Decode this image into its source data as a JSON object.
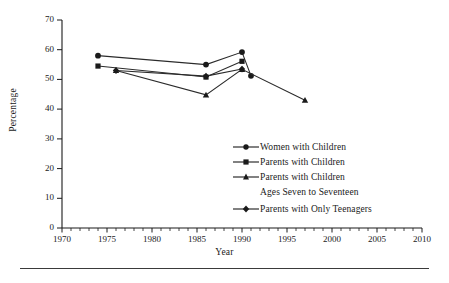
{
  "chart_data": {
    "type": "line",
    "title": "",
    "xlabel": "Year",
    "ylabel": "Percentage",
    "xlim": [
      1970,
      2010
    ],
    "ylim": [
      0,
      70
    ],
    "xticks": [
      1970,
      1975,
      1980,
      1985,
      1990,
      1995,
      2000,
      2005,
      2010
    ],
    "yticks": [
      0,
      10,
      20,
      30,
      40,
      50,
      60,
      70
    ],
    "xtick_step_minor": 1,
    "grid": false,
    "legend_position": "center-right",
    "series": [
      {
        "name": "Women with Children",
        "marker": "circle",
        "x": [
          1974,
          1986,
          1990,
          1991
        ],
        "y": [
          58.0,
          55.0,
          59.2,
          51.2
        ]
      },
      {
        "name": "Parents with Children",
        "marker": "square",
        "x": [
          1974,
          1986,
          1990
        ],
        "y": [
          54.5,
          50.8,
          56.1
        ]
      },
      {
        "name": "Parents with Children Ages Seven to Seventeen",
        "marker": "triangle",
        "x": [
          1976,
          1986,
          1990,
          1997
        ],
        "y": [
          53.0,
          44.8,
          53.4,
          43.0
        ]
      },
      {
        "name": "Parents with Only Teenagers",
        "marker": "diamond",
        "x": [
          1976,
          1986,
          1990
        ],
        "y": [
          53.0,
          51.1,
          53.5
        ]
      }
    ]
  },
  "axes": {
    "ylabel": "Percentage",
    "xlabel": "Year",
    "ytick_labels": [
      "0",
      "10",
      "20",
      "30",
      "40",
      "50",
      "60",
      "70"
    ],
    "xtick_labels": [
      "1970",
      "1975",
      "1980",
      "1985",
      "1990",
      "1995",
      "2000",
      "2005",
      "2010"
    ]
  },
  "legend": {
    "entries": [
      {
        "label": "Women with Children",
        "label2": "",
        "marker": "circle-marker"
      },
      {
        "label": "Parents with Children",
        "label2": "",
        "marker": "square-marker"
      },
      {
        "label": "Parents with Children",
        "label2": "Ages Seven to Seventeen",
        "marker": "triangle-marker"
      },
      {
        "label": "Parents with Only Teenagers",
        "label2": "",
        "marker": "diamond-marker"
      }
    ]
  },
  "colors": {
    "ink": "#1a1a1a",
    "line": "#2b2b2b",
    "rule": "#3a3a3a",
    "background": "#ffffff"
  }
}
